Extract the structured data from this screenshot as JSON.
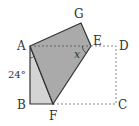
{
  "diagram": {
    "type": "folded-rectangle",
    "points": {
      "A": {
        "label": "A",
        "x": 30,
        "y": 46
      },
      "B": {
        "label": "B",
        "x": 30,
        "y": 104
      },
      "C": {
        "label": "C",
        "x": 116,
        "y": 104
      },
      "D": {
        "label": "D",
        "x": 116,
        "y": 46
      },
      "E": {
        "label": "E",
        "x": 91,
        "y": 46
      },
      "F": {
        "label": "F",
        "x": 53,
        "y": 104
      },
      "G": {
        "label": "G",
        "x": 81,
        "y": 23
      }
    },
    "angle_label": "24°",
    "unknown_label": "x",
    "colors": {
      "dark_fill": "#aaaaaa",
      "light_fill": "#d4d4d4",
      "stroke": "#333333",
      "dashed": "#888888"
    }
  }
}
